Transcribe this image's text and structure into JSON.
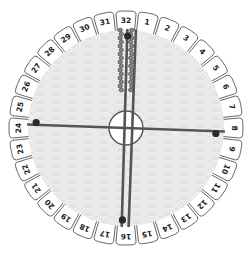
{
  "diagram": {
    "slot_count": 32,
    "slots": [
      "1",
      "2",
      "3",
      "4",
      "5",
      "6",
      "7",
      "8",
      "9",
      "10",
      "11",
      "12",
      "13",
      "14",
      "15",
      "16",
      "17",
      "18",
      "19",
      "20",
      "21",
      "22",
      "23",
      "24",
      "25",
      "26",
      "27",
      "28",
      "29",
      "30",
      "31",
      "32"
    ],
    "strands": [
      {
        "name": "strand-north-pair",
        "from_slot": 32,
        "to_slot": 1,
        "style": "twisted",
        "dot_slot": 32
      },
      {
        "name": "strand-east-west",
        "from_slot": 24,
        "to_slot": 8,
        "style": "straight",
        "dot_slots": [
          24,
          8
        ]
      },
      {
        "name": "strand-south",
        "from_slot": 16,
        "to_slot": 32,
        "style": "straight",
        "dot_slot": 16
      }
    ],
    "colors": {
      "disc_fill": "#e4e4e4",
      "pattern": "#f0f0f0",
      "tab_fill": "#ffffff",
      "tab_stroke": "#555555",
      "strand": "#555555",
      "dot": "#2a2a2a",
      "label": "#222222"
    }
  }
}
